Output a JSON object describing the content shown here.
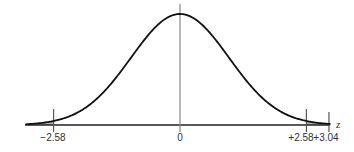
{
  "chart_data": {
    "type": "area",
    "title": "",
    "xlabel": "z",
    "ylabel": "",
    "xlim": [
      -3.3,
      3.3
    ],
    "grid": false,
    "legend": null,
    "curve": "standard normal density",
    "mean": 0,
    "sd": 1,
    "shaded_regions": [
      {
        "name": "left-tail",
        "from": -3.3,
        "to": -2.58,
        "color": "#b0b0b0"
      },
      {
        "name": "right-tail",
        "from": 2.58,
        "to": 3.3,
        "color": "#b0b0b0"
      }
    ],
    "vertical_markers": [
      {
        "value": -2.58,
        "label": "−2.58"
      },
      {
        "value": 0,
        "label": "0"
      },
      {
        "value": 2.58,
        "label": "+2.58"
      },
      {
        "value": 3.04,
        "label": "+3.04"
      }
    ],
    "tick_labels": [
      "−2.58",
      "0",
      "+2.58",
      "+3.04"
    ]
  },
  "labels": {
    "neg_crit": "−2.58",
    "zero": "0",
    "pos_crit": "+2.58",
    "observed": "+3.04",
    "axis_var": "z"
  },
  "colors": {
    "curve": "#111111",
    "axis": "#222222",
    "shade": "#b3b3b3",
    "marker": "#555555"
  }
}
